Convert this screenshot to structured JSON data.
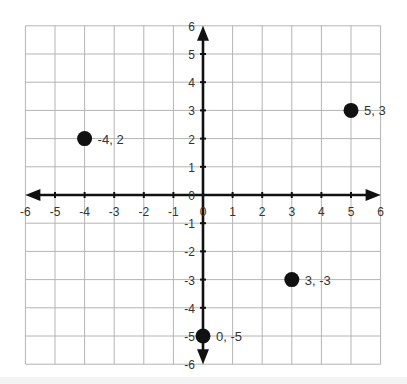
{
  "chart_data": {
    "type": "scatter",
    "title": "",
    "xlabel": "",
    "ylabel": "",
    "xlim": [
      -6,
      6
    ],
    "ylim": [
      -6,
      6
    ],
    "grid": true,
    "legend": null,
    "x_ticks": [
      "-6",
      "-5",
      "-4",
      "-3",
      "-2",
      "-1",
      "0",
      "1",
      "2",
      "3",
      "4",
      "5",
      "6"
    ],
    "y_ticks": [
      "6",
      "5",
      "4",
      "3",
      "2",
      "1",
      "0",
      "-1",
      "-2",
      "-3",
      "-4",
      "-5",
      "-6"
    ],
    "points": [
      {
        "x": -4,
        "y": 2,
        "label": "-4, 2"
      },
      {
        "x": 5,
        "y": 3,
        "label": "5, 3"
      },
      {
        "x": 3,
        "y": -3,
        "label": "3, -3"
      },
      {
        "x": 0,
        "y": -5,
        "label": "0, -5"
      }
    ]
  },
  "style": {
    "grid_color": "#b4b4b4",
    "axis_color": "#111111",
    "point_color": "#111111",
    "text_color": "#333333"
  },
  "layout": {
    "origin_x": 203,
    "origin_y": 195,
    "unit_x": 29.6,
    "unit_y": 28.2
  }
}
